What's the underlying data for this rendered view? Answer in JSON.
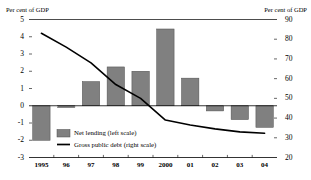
{
  "chart_data": {
    "type": "bar",
    "title": "",
    "subtitle": "",
    "xlabel": "",
    "ylabel": "Per cent of GDP",
    "ylabel_right": "Per cent of GDP",
    "grid": false,
    "legend_position": "inside-bottom-left",
    "categories": [
      "1995",
      "96",
      "97",
      "98",
      "99",
      "2000",
      "01",
      "02",
      "03",
      "04"
    ],
    "ylim": [
      -3,
      5
    ],
    "yticks": [
      "5",
      "4",
      "3",
      "2",
      "1",
      "0",
      "-1",
      "-2",
      "-3"
    ],
    "ytick_values": [
      5,
      4,
      3,
      2,
      1,
      0,
      -1,
      -2,
      -3
    ],
    "ylim_right": [
      20,
      90
    ],
    "yticks_right": [
      "90",
      "80",
      "70",
      "60",
      "50",
      "40",
      "30",
      "20"
    ],
    "ytick_values_right": [
      90,
      80,
      70,
      60,
      50,
      40,
      30,
      20
    ],
    "series": [
      {
        "name": "Net lending (left scale)",
        "type": "bar",
        "axis": "left",
        "color": "#808080",
        "edge_color": "#4d4d4d",
        "values": [
          -2.0,
          -0.1,
          1.4,
          2.25,
          2.0,
          4.45,
          1.6,
          -0.3,
          -0.8,
          -1.25
        ]
      },
      {
        "name": "Gross public debt (right scale)",
        "type": "line",
        "axis": "right",
        "color": "#000000",
        "values": [
          83,
          76,
          68,
          57,
          50,
          39,
          36.5,
          34.5,
          33,
          32.3
        ]
      }
    ]
  },
  "legend": {
    "items": [
      {
        "label": "Net lending (left scale)",
        "marker": "swatch",
        "color": "#808080"
      },
      {
        "label": "Gross public debt (right scale)",
        "marker": "line",
        "color": "#000000"
      }
    ]
  }
}
